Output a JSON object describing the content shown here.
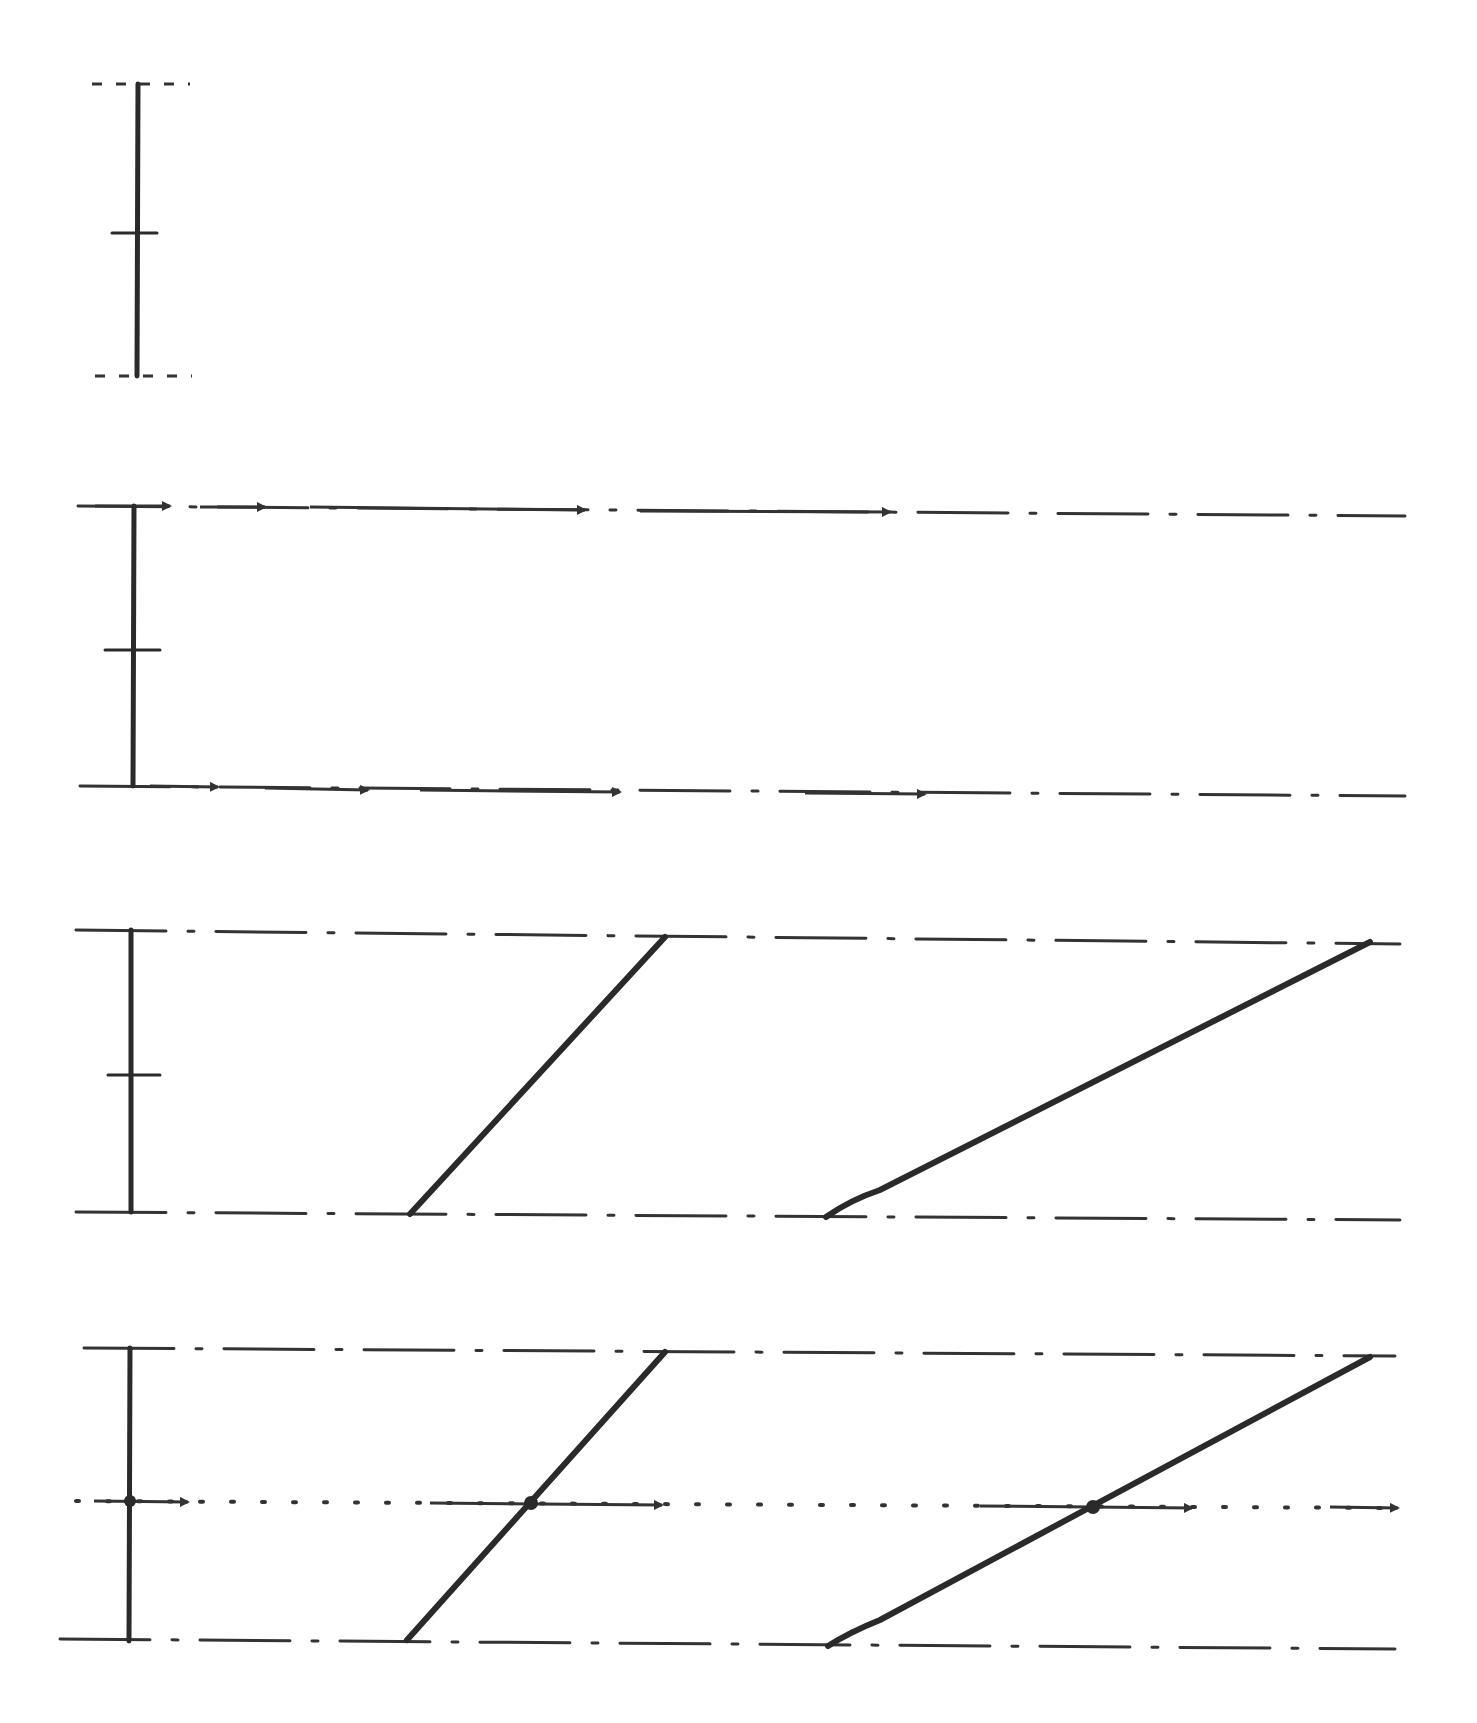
{
  "diagram": {
    "colors": {
      "ink": "#2a2a2a",
      "background": "#ffffff"
    },
    "panels": [
      {
        "id": "panel-1",
        "segment": {
          "x": 138,
          "y_top": 84,
          "y_bottom": 376,
          "mid_tick_y": 233
        },
        "boundaries": [
          {
            "y": 84,
            "style": "dashed",
            "x1": 92,
            "x2": 190
          },
          {
            "y": 376,
            "style": "dashed",
            "x1": 95,
            "x2": 192
          }
        ]
      },
      {
        "id": "panel-2",
        "segment": {
          "x": 134,
          "y_top": 506,
          "y_bottom": 786,
          "mid_tick_y": 650
        },
        "boundaries": [
          {
            "y1": 506,
            "y2": 516,
            "style": "dash-dot",
            "x1": 78,
            "x2": 1405,
            "arrows_at_x": [
              170,
              265,
              585,
              890
            ]
          },
          {
            "y1": 786,
            "y2": 796,
            "style": "dash-dot",
            "x1": 80,
            "x2": 1405,
            "arrows_at_x": [
              218,
              368,
              620,
              925
            ]
          }
        ]
      },
      {
        "id": "panel-3",
        "segment": {
          "x": 131,
          "y_top": 930,
          "y_bottom": 1212,
          "mid_tick_y": 1075
        },
        "boundaries": [
          {
            "y1": 930,
            "y2": 944,
            "style": "dash-dot",
            "x1": 76,
            "x2": 1400
          },
          {
            "y1": 1212,
            "y2": 1220,
            "style": "dash-dot",
            "x1": 76,
            "x2": 1400
          }
        ],
        "slanted_lines": [
          {
            "x1": 410,
            "y1": 1214,
            "x2": 665,
            "y2": 937
          },
          {
            "x1": 826,
            "y1": 1217,
            "x2": 1370,
            "y2": 942
          }
        ]
      },
      {
        "id": "panel-4",
        "segment": {
          "x": 130,
          "y_top": 1348,
          "y_bottom": 1641
        },
        "boundaries": [
          {
            "y1": 1348,
            "y2": 1356,
            "style": "dash-dot",
            "x1": 84,
            "x2": 1395
          },
          {
            "y1": 1639,
            "y2": 1649,
            "style": "dash-dot",
            "x1": 60,
            "x2": 1395
          }
        ],
        "slanted_lines": [
          {
            "x1": 407,
            "y1": 1640,
            "x2": 665,
            "y2": 1352
          },
          {
            "x1": 828,
            "y1": 1646,
            "x2": 1370,
            "y2": 1357
          }
        ],
        "midline": {
          "y1": 1501,
          "y2": 1508,
          "x1": 76,
          "x2": 1400,
          "style": "dotted-with-arrows",
          "intersection_points": [
            [
              130,
              1501
            ],
            [
              531,
              1503
            ],
            [
              1093,
              1507
            ]
          ],
          "arrows_at_x": [
            188,
            662,
            1192,
            1395
          ]
        }
      }
    ]
  }
}
